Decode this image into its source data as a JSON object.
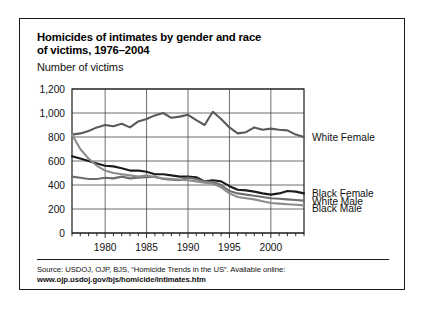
{
  "figure": {
    "title_line1": "Homicides of intimates by gender and race",
    "title_line2": "of victims, 1976–2004",
    "subtitle": "Number of victims",
    "source_line1": "Source: USDOJ, OJP, BJS, “Homicide Trends in the US”. Available online:",
    "source_line2": "www.ojp.usdoj.gov/bjs/homicide/intimates.htm"
  },
  "colors": {
    "frame": "#1b1b1b",
    "grid": "#4a4a4a",
    "white_female": "#5a5a5a",
    "black_female": "#1b1b1b",
    "white_male": "#6e6e6e",
    "black_male": "#8c8c8c",
    "background": "#ffffff"
  },
  "chart_data": {
    "type": "line",
    "title": "Homicides of intimates by gender and race of victims, 1976–2004",
    "xlabel": "",
    "ylabel": "Number of victims",
    "xlim": [
      1976,
      2004
    ],
    "ylim": [
      0,
      1200
    ],
    "yticks": [
      0,
      200,
      400,
      600,
      800,
      1000,
      1200
    ],
    "ytick_labels": [
      "0",
      "200",
      "400",
      "600",
      "800",
      "1,000",
      "1,200"
    ],
    "xticks": [
      1980,
      1985,
      1990,
      1995,
      2000
    ],
    "xtick_labels": [
      "1980",
      "1985",
      "1990",
      "1995",
      "2000"
    ],
    "minor_xtick_interval": 1,
    "grid": true,
    "legend_position": "right-inline",
    "x": [
      1976,
      1977,
      1978,
      1979,
      1980,
      1981,
      1982,
      1983,
      1984,
      1985,
      1986,
      1987,
      1988,
      1989,
      1990,
      1991,
      1992,
      1993,
      1994,
      1995,
      1996,
      1997,
      1998,
      1999,
      2000,
      2001,
      2002,
      2003,
      2004
    ],
    "series": [
      {
        "name": "White Female",
        "label": "White Female",
        "color": "#5a5a5a",
        "values": [
          820,
          830,
          850,
          880,
          900,
          890,
          910,
          880,
          930,
          950,
          980,
          1000,
          960,
          970,
          985,
          940,
          900,
          1010,
          950,
          880,
          830,
          840,
          880,
          860,
          870,
          860,
          855,
          820,
          800
        ]
      },
      {
        "name": "Black Female",
        "label": "Black Female",
        "color": "#1b1b1b",
        "values": [
          640,
          620,
          600,
          580,
          560,
          555,
          540,
          520,
          520,
          510,
          490,
          490,
          480,
          470,
          470,
          465,
          430,
          440,
          430,
          390,
          360,
          355,
          345,
          330,
          320,
          330,
          350,
          345,
          330
        ]
      },
      {
        "name": "White Male",
        "label": "White Male",
        "color": "#6e6e6e",
        "values": [
          470,
          460,
          450,
          450,
          460,
          455,
          470,
          455,
          460,
          465,
          470,
          450,
          445,
          440,
          460,
          450,
          430,
          425,
          400,
          350,
          330,
          320,
          310,
          300,
          290,
          285,
          280,
          275,
          270
        ]
      },
      {
        "name": "Black Male",
        "label": "Black Male",
        "color": "#8c8c8c",
        "values": [
          820,
          700,
          620,
          560,
          520,
          500,
          490,
          480,
          470,
          480,
          465,
          455,
          450,
          445,
          440,
          430,
          420,
          410,
          380,
          330,
          300,
          290,
          280,
          265,
          250,
          245,
          240,
          235,
          230
        ]
      }
    ]
  }
}
